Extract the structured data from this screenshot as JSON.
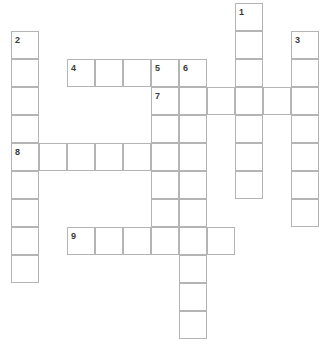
{
  "puzzle": {
    "type": "crossword-grid",
    "title": "",
    "cell_size": 28,
    "origin_x": 11,
    "origin_y": 3,
    "grid_line_color": "#b4b4b4",
    "cell_fill_color": "#ffffff",
    "background_color": "#ffffff",
    "number_color": "#3a3a3a",
    "entries": [
      {
        "number": "1",
        "direction": "down",
        "length": 7,
        "start_col": 8,
        "start_row": 0
      },
      {
        "number": "2",
        "direction": "down",
        "length": 9,
        "start_col": 0,
        "start_row": 1
      },
      {
        "number": "3",
        "direction": "down",
        "length": 7,
        "start_col": 10,
        "start_row": 1
      },
      {
        "number": "4",
        "direction": "across",
        "length": 4,
        "start_col": 2,
        "start_row": 2
      },
      {
        "number": "5",
        "direction": "down",
        "length": 7,
        "start_col": 5,
        "start_row": 2
      },
      {
        "number": "6",
        "direction": "down",
        "length": 10,
        "start_col": 6,
        "start_row": 2
      },
      {
        "number": "7",
        "direction": "across",
        "length": 6,
        "start_col": 5,
        "start_row": 3
      },
      {
        "number": "8",
        "direction": "across",
        "length": 5,
        "start_col": 0,
        "start_row": 5
      },
      {
        "number": "9",
        "direction": "across",
        "length": 6,
        "start_col": 2,
        "start_row": 8
      }
    ],
    "numbered_labels": [
      {
        "number": "1",
        "col": 8,
        "row": 0
      },
      {
        "number": "2",
        "col": 0,
        "row": 1
      },
      {
        "number": "3",
        "col": 10,
        "row": 1
      },
      {
        "number": "4",
        "col": 2,
        "row": 2
      },
      {
        "number": "5",
        "col": 5,
        "row": 2
      },
      {
        "number": "6",
        "col": 6,
        "row": 2
      },
      {
        "number": "7",
        "col": 5,
        "row": 3
      },
      {
        "number": "8",
        "col": 0,
        "row": 5
      },
      {
        "number": "9",
        "col": 2,
        "row": 8
      }
    ]
  }
}
